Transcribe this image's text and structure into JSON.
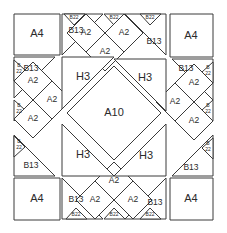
{
  "diagram": {
    "type": "quilt-block-layout",
    "width": 227,
    "height": 233,
    "background_color": "#ffffff",
    "line_color": "#3a3a3a",
    "label_color": "#2b2b2b",
    "piece_codes": [
      "A4",
      "A2",
      "A10",
      "B13",
      "B22",
      "H3"
    ],
    "pieces": [
      {
        "id": "corner-tl-a4",
        "name": "corner-square-top-left",
        "code": "A4",
        "shape": "square",
        "points": "14,14 60,14 60,55 14,55",
        "lx": 37,
        "ly": 34,
        "size": "label-lg"
      },
      {
        "id": "corner-tr-a4",
        "name": "corner-square-top-right",
        "code": "A4",
        "shape": "square",
        "points": "170,14 213,14 213,57 170,57",
        "lx": 191,
        "ly": 36,
        "size": "label-lg"
      },
      {
        "id": "corner-bl-a4",
        "name": "corner-square-bottom-left",
        "code": "A4",
        "shape": "square",
        "points": "14,178 60,178 60,220 14,220",
        "lx": 37,
        "ly": 199,
        "size": "label-lg"
      },
      {
        "id": "corner-br-a4",
        "name": "corner-square-bottom-right",
        "code": "A4",
        "shape": "square",
        "points": "170,178 213,178 213,220 170,220",
        "lx": 191,
        "ly": 199,
        "size": "label-lg"
      },
      {
        "id": "top-b13",
        "name": "triangle-top-left-b13",
        "code": "B13",
        "shape": "triangle",
        "points": "62,14 62,55 103,14",
        "lx": 76,
        "ly": 31,
        "size": "label-md"
      },
      {
        "id": "topright-b13",
        "name": "triangle-top-right-b13",
        "code": "B13",
        "shape": "triangle",
        "points": "166,55 125,14 166,14",
        "lx": 154,
        "ly": 42,
        "size": "label-md"
      },
      {
        "id": "left-b13-upper",
        "name": "triangle-left-upper-b13",
        "code": "B13",
        "shape": "triangle",
        "points": "14,57 55,57 14,98",
        "lx": 31,
        "ly": 69,
        "size": "label-md"
      },
      {
        "id": "left-b13-lower",
        "name": "triangle-left-lower-b13",
        "code": "B13",
        "shape": "triangle",
        "points": "14,135 14,176 55,176",
        "lx": 31,
        "ly": 166,
        "size": "label-md"
      },
      {
        "id": "right-b13-upper",
        "name": "triangle-right-upper-b13",
        "code": "B13",
        "shape": "triangle",
        "points": "172,59 213,59 213,100",
        "lx": 186,
        "ly": 69,
        "size": "label-md"
      },
      {
        "id": "right-b13-lower",
        "name": "triangle-right-lower-b13",
        "code": "B13",
        "shape": "triangle",
        "points": "172,176 213,135 213,176",
        "lx": 191,
        "ly": 168,
        "size": "label-md"
      },
      {
        "id": "bottom-left-b13",
        "name": "triangle-bottom-left-b13",
        "code": "B13",
        "shape": "triangle",
        "points": "62,178 103,219 62,219",
        "lx": 76,
        "ly": 200,
        "size": "label-md"
      },
      {
        "id": "bottom-right-b13",
        "name": "triangle-bottom-right-b13",
        "code": "B13",
        "shape": "triangle",
        "points": "166,178 166,219 125,219",
        "lx": 155,
        "ly": 203,
        "size": "label-md"
      },
      {
        "id": "b22-t1",
        "name": "small-triangle-top-1-b22",
        "code": "B22",
        "shape": "triangle",
        "points": "64,14 85,14 74,25",
        "lx": 74,
        "ly": 18,
        "size": "label-xs"
      },
      {
        "id": "b22-t2",
        "name": "small-triangle-top-2-b22",
        "code": "B22",
        "shape": "triangle",
        "points": "104,14 125,14 114,25",
        "lx": 114,
        "ly": 18,
        "size": "label-xs"
      },
      {
        "id": "b22-t3",
        "name": "small-triangle-top-3-b22",
        "code": "B22",
        "shape": "triangle",
        "points": "140,14 161,14 150,25",
        "lx": 150,
        "ly": 18,
        "size": "label-xs"
      },
      {
        "id": "b22-l1",
        "name": "small-triangle-left-1-b22",
        "code": "B22",
        "shape": "triangle",
        "points": "14,60 14,81 25,70",
        "lx": 19,
        "ly": 70,
        "size": "label-xs",
        "stacked": true
      },
      {
        "id": "b22-l2",
        "name": "small-triangle-left-2-b22",
        "code": "B22",
        "shape": "triangle",
        "points": "14,100 14,121 25,110",
        "lx": 19,
        "ly": 110,
        "size": "label-xs",
        "stacked": true
      },
      {
        "id": "b22-l3",
        "name": "small-triangle-left-3-b22",
        "code": "B22",
        "shape": "triangle",
        "points": "14,136 14,157 25,147",
        "lx": 19,
        "ly": 146,
        "size": "label-xs",
        "stacked": true
      },
      {
        "id": "b22-r1",
        "name": "small-triangle-right-1-b22",
        "code": "B22",
        "shape": "triangle",
        "points": "213,62 213,83 202,72",
        "lx": 208,
        "ly": 72,
        "size": "label-xs",
        "stacked": true
      },
      {
        "id": "b22-r2",
        "name": "small-triangle-right-2-b22",
        "code": "B22",
        "shape": "triangle",
        "points": "213,100 213,121 202,110",
        "lx": 208,
        "ly": 110,
        "size": "label-xs",
        "stacked": true
      },
      {
        "id": "b22-r3",
        "name": "small-triangle-right-3-b22",
        "code": "B22",
        "shape": "triangle",
        "points": "213,138 213,159 202,148",
        "lx": 208,
        "ly": 148,
        "size": "label-xs",
        "stacked": true
      },
      {
        "id": "b22-b1",
        "name": "small-triangle-bottom-1-b22",
        "code": "B22",
        "shape": "triangle",
        "points": "66,219 87,219 76,208",
        "lx": 76,
        "ly": 215,
        "size": "label-xs"
      },
      {
        "id": "b22-b2",
        "name": "small-triangle-bottom-2-b22",
        "code": "B22",
        "shape": "triangle",
        "points": "104,219 125,219 114,208",
        "lx": 114,
        "ly": 215,
        "size": "label-xs"
      },
      {
        "id": "b22-b3",
        "name": "small-triangle-bottom-3-b22",
        "code": "B22",
        "shape": "triangle",
        "points": "140,219 161,219 150,208",
        "lx": 150,
        "ly": 215,
        "size": "label-xs"
      },
      {
        "id": "a2-t1",
        "name": "diamond-top-1-a2",
        "code": "A2",
        "shape": "diamond",
        "points": "86,14 105,33 86,52 67,33",
        "lx": 86,
        "ly": 33,
        "size": "label-md"
      },
      {
        "id": "a2-t2",
        "name": "diamond-top-2-a2",
        "code": "A2",
        "shape": "diamond",
        "points": "124,14 143,33 124,52 105,33",
        "lx": 124,
        "ly": 33,
        "size": "label-md"
      },
      {
        "id": "a2-t3",
        "name": "diamond-top-3-a2",
        "code": "A2",
        "shape": "diamond",
        "points": "105,33 124,52 105,71 86,52",
        "lx": 105,
        "ly": 52,
        "size": "label-md"
      },
      {
        "id": "a2-l1",
        "name": "diamond-left-1-a2",
        "code": "A2",
        "shape": "diamond",
        "points": "33,62 52,81 33,100 14,81",
        "lx": 33,
        "ly": 81,
        "size": "label-md"
      },
      {
        "id": "a2-l2",
        "name": "diamond-left-2-a2",
        "code": "A2",
        "shape": "diamond",
        "points": "33,100 52,119 33,138 14,119",
        "lx": 33,
        "ly": 119,
        "size": "label-md"
      },
      {
        "id": "a2-l3",
        "name": "diamond-left-3-a2",
        "code": "A2",
        "shape": "diamond",
        "points": "52,81 71,100 52,119 33,100",
        "lx": 52,
        "ly": 100,
        "size": "label-md"
      },
      {
        "id": "a2-r1",
        "name": "diamond-right-1-a2",
        "code": "A2",
        "shape": "diamond",
        "points": "194,64 213,83 194,102 175,83",
        "lx": 194,
        "ly": 83,
        "size": "label-md"
      },
      {
        "id": "a2-r2",
        "name": "diamond-right-2-a2",
        "code": "A2",
        "shape": "diamond",
        "points": "194,102 213,121 194,140 175,121",
        "lx": 194,
        "ly": 121,
        "size": "label-md"
      },
      {
        "id": "a2-r3",
        "name": "diamond-right-3-a2",
        "code": "A2",
        "shape": "diamond",
        "points": "175,83 194,102 175,121 156,102",
        "lx": 175,
        "ly": 102,
        "size": "label-md"
      },
      {
        "id": "a2-b1",
        "name": "diamond-bottom-1-a2",
        "code": "A2",
        "shape": "diamond",
        "points": "114,162 133,181 114,200 95,181",
        "lx": 114,
        "ly": 181,
        "size": "label-md"
      },
      {
        "id": "a2-b2",
        "name": "diamond-bottom-2-a2",
        "code": "A2",
        "shape": "diamond",
        "points": "95,181 114,200 95,219 76,200",
        "lx": 95,
        "ly": 200,
        "size": "label-md"
      },
      {
        "id": "a2-b3",
        "name": "diamond-bottom-3-a2",
        "code": "A2",
        "shape": "diamond",
        "points": "133,181 152,200 133,219 114,200",
        "lx": 133,
        "ly": 200,
        "size": "label-md"
      },
      {
        "id": "h3-tl",
        "name": "large-triangle-top-left-h3",
        "code": "H3",
        "shape": "triangle",
        "points": "62,57 114,57 62,109",
        "lx": 83,
        "ly": 77,
        "size": "label-lg"
      },
      {
        "id": "h3-tr",
        "name": "large-triangle-top-right-h3",
        "code": "H3",
        "shape": "triangle",
        "points": "166,59 166,111 114,59",
        "lx": 145,
        "ly": 78,
        "size": "label-lg"
      },
      {
        "id": "h3-bl",
        "name": "large-triangle-bottom-left-h3",
        "code": "H3",
        "shape": "triangle",
        "points": "62,124 62,176 114,176",
        "lx": 83,
        "ly": 155,
        "size": "label-lg"
      },
      {
        "id": "h3-br",
        "name": "large-triangle-bottom-right-h3",
        "code": "H3",
        "shape": "triangle",
        "points": "166,124 166,176 114,176",
        "lx": 146,
        "ly": 156,
        "size": "label-lg"
      },
      {
        "id": "center-a10",
        "name": "center-diamond-a10",
        "code": "A10",
        "shape": "diamond",
        "points": "114,66 161,113 114,160 67,113",
        "lx": 114,
        "ly": 113,
        "size": "label-lg"
      }
    ]
  }
}
